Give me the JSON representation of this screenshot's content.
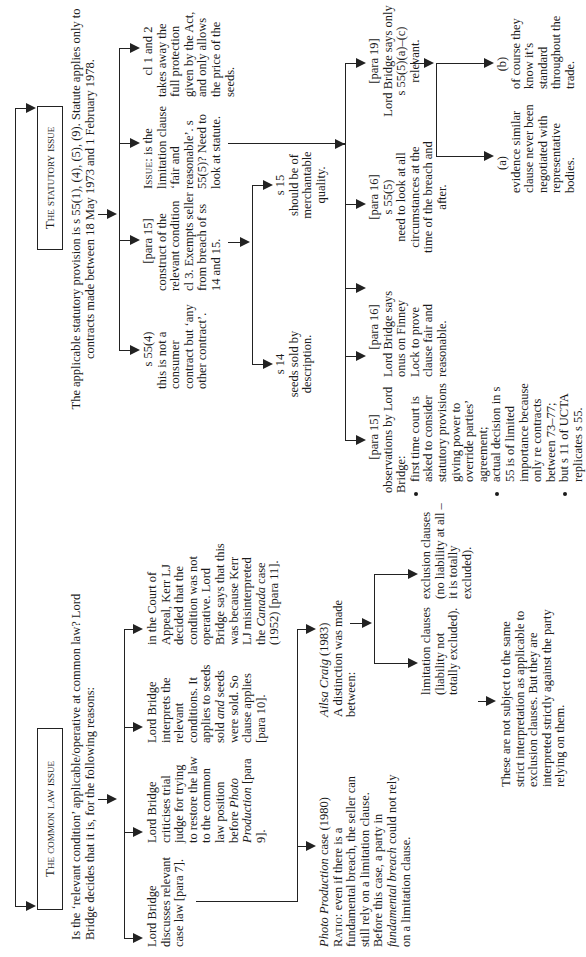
{
  "diagram": {
    "orientation": "rotated-90-ccw",
    "root": {
      "statutory_issue": {
        "title": "The statutory issue",
        "intro": "The applicable statutory provision is s 55(1), (4), (5), (9). Statute applies only to contracts made between 18 May 1973 and 1 February 1978.",
        "branches": [
          {
            "id": "s55-4",
            "heading": "s 55(4)",
            "text": "this is not a consumer contract but ‘any other contract’."
          },
          {
            "id": "para15-construct",
            "heading": "[para 15]",
            "text": "construct of the relevant condition cl 3. Exempts seller from breach of ss 14 and 15.",
            "children": [
              {
                "id": "s14",
                "heading": "s 14",
                "text": "seeds sold by description."
              },
              {
                "id": "s15",
                "heading": "s 15",
                "text": "should be of merchantable quality."
              }
            ]
          },
          {
            "id": "issue",
            "label": "Issue:",
            "text": "is the limitation clause ‘fair and reasonable’. s 55(5)? Need to look at statute.",
            "children": [
              {
                "id": "para15-obs",
                "heading": "[para 15]",
                "text": "observations by Lord Bridge:",
                "bullets": [
                  "first time court is asked to consider statutory provisions giving power to override parties’ agreement;",
                  "actual decision in s 55 is of limited importance because only re contracts between 73–77;",
                  "but s 11 of UCTA replicates s 55."
                ]
              },
              {
                "id": "para16-onus",
                "heading": "[para 16]",
                "text": "Lord Bridge says onus on Finney Lock to prove clause fair and reasonable."
              },
              {
                "id": "para17",
                "heading": "[para 17]",
                "subheading": "s 55 (4)",
                "text": "what is the meaning of phrase ‘to the extent that …’? (Says it is not relevant.)"
              },
              {
                "id": "para16-circ",
                "heading": "[para 16]",
                "subheading": "s 55(5)",
                "text": "need to look at all circumstances at the time of the breach and after."
              },
              {
                "id": "para19",
                "heading": "[para 19]",
                "text": "Lord Bridge says only s 55(5)(a)–(c) relevant.",
                "children": [
                  {
                    "id": "a",
                    "heading": "(a)",
                    "text": "evidence similar clause never been negotiated with representative bodies."
                  },
                  {
                    "id": "b",
                    "heading": "(b)",
                    "text": "of course they know it’s standard throughout the trade."
                  }
                ]
              }
            ]
          },
          {
            "id": "cl12",
            "heading": "cl 1 and 2",
            "text": "takes away the full protection given by the Act, and only allows the price of the seeds."
          }
        ]
      },
      "common_law_issue": {
        "title": "The common law issue",
        "intro": "Is the ‘relevant condition’ applicable/operative at common law? Lord Bridge decides that it is, for the following reasons:",
        "branches": [
          {
            "id": "discusses",
            "text": "Lord Bridge discusses relevant case law [para 7].",
            "children": [
              {
                "id": "photo",
                "case": "Photo Production",
                "case_suffix": " case (1980)",
                "ratio_label": "Ratio:",
                "ratio": "even if there is a fundamental breach, the seller can still rely on a limitation clause. Before this case, a party in",
                "ratio_italic": "fundamental breach",
                "ratio_end": "could not rely on a limitation clause."
              },
              {
                "id": "ailsa",
                "case": "Ailsa Craig",
                "case_suffix": " (1983)",
                "text": "A distinction was made between:",
                "children": [
                  {
                    "id": "limitation",
                    "text": "limitation clauses (liability not totally excluded).",
                    "children": [
                      {
                        "id": "these",
                        "text": "These are not subject to the same strict interpretation as applicable to exclusion clauses. But they are interpreted strictly against the party relying on them."
                      }
                    ]
                  },
                  {
                    "id": "exclusion",
                    "text": "exclusion clauses (no liability at all – it is totally excluded)."
                  }
                ]
              }
            ]
          },
          {
            "id": "criticises",
            "text_a": "Lord Bridge criticises trial judge for trying to restore the law to the common law position before",
            "italic": "Photo Production",
            "text_b": "[para 9]."
          },
          {
            "id": "interprets",
            "text_a": "Lord Bridge interprets the relevant conditions. It applies to seeds sold",
            "italic": "and",
            "text_b": "seeds were sold. So clause applies [para 10]."
          },
          {
            "id": "appeal",
            "text_a": "in the Court of Appeal, Kerr LJ decided that the condition was not operative. Lord Bridge says that this was because Kerr LJ misinterpreted the",
            "italic": "Canada",
            "text_b": "case (1952) [para 11]."
          }
        ]
      }
    }
  },
  "colors": {
    "ink": "#1a1a1a",
    "background": "#ffffff"
  }
}
